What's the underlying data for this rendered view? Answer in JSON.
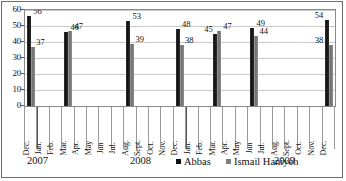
{
  "chart_data": {
    "type": "bar",
    "title": "",
    "xlabel": "",
    "ylabel": "",
    "ylim": [
      0,
      60
    ],
    "ytick_values": [
      0,
      10,
      20,
      30,
      40,
      50,
      60
    ],
    "grid": true,
    "legend_position": "bottom-center",
    "categories": [
      "Dec. 2007",
      "Mar. 2008",
      "Aug. 2008",
      "Dec. 2008",
      "Mar. 2009",
      "Jun 2009",
      "Dec. 2009"
    ],
    "series": [
      {
        "name": "Abbas",
        "color": "#111111",
        "values": [
          56,
          46,
          53,
          48,
          45,
          49,
          54
        ]
      },
      {
        "name": "Ismail Haniyeh",
        "color": "#808080",
        "values": [
          37,
          47,
          39,
          38,
          47,
          44,
          38
        ]
      }
    ],
    "month_axis": [
      {
        "label": "Dec.",
        "year": "2007",
        "bar_index": 0
      },
      {
        "label": "Jan.",
        "year": "2008",
        "bar_index": null
      },
      {
        "label": "Feb.",
        "year": "2008",
        "bar_index": null
      },
      {
        "label": "Mar.",
        "year": "2008",
        "bar_index": 1
      },
      {
        "label": "Apr.",
        "year": "2008",
        "bar_index": null
      },
      {
        "label": "May",
        "year": "2008",
        "bar_index": null
      },
      {
        "label": "Jun",
        "year": "2008",
        "bar_index": null
      },
      {
        "label": "Jul.",
        "year": "2008",
        "bar_index": null
      },
      {
        "label": "Aug.",
        "year": "2008",
        "bar_index": 2
      },
      {
        "label": "Sept.",
        "year": "2008",
        "bar_index": null
      },
      {
        "label": "Oct.",
        "year": "2008",
        "bar_index": null
      },
      {
        "label": "Nov.",
        "year": "2008",
        "bar_index": null
      },
      {
        "label": "Dec.",
        "year": "2008",
        "bar_index": 3
      },
      {
        "label": "Jan.",
        "year": "2009",
        "bar_index": null
      },
      {
        "label": "Feb.",
        "year": "2009",
        "bar_index": null
      },
      {
        "label": "Mar.",
        "year": "2009",
        "bar_index": 4
      },
      {
        "label": "Apr.",
        "year": "2009",
        "bar_index": null
      },
      {
        "label": "May",
        "year": "2009",
        "bar_index": null
      },
      {
        "label": "Jun",
        "year": "2009",
        "bar_index": 5
      },
      {
        "label": "Jul.",
        "year": "2009",
        "bar_index": null
      },
      {
        "label": "Aug.",
        "year": "2009",
        "bar_index": null
      },
      {
        "label": "Sept.",
        "year": "2009",
        "bar_index": null
      },
      {
        "label": "Oct.",
        "year": "2009",
        "bar_index": null
      },
      {
        "label": "Nov.",
        "year": "2009",
        "bar_index": null
      },
      {
        "label": "Dec.",
        "year": "2009",
        "bar_index": 6
      }
    ],
    "year_labels": [
      "2007",
      "2008",
      "2009"
    ]
  }
}
